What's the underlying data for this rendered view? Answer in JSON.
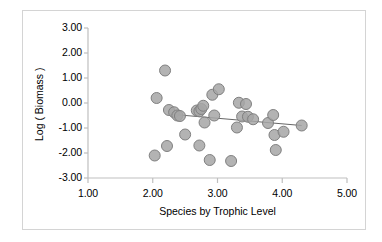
{
  "chart_data": {
    "type": "scatter",
    "title": "",
    "xlabel": "Species by Trophic Level",
    "ylabel": "Log ( Biomass )",
    "xlim": [
      1.0,
      5.0
    ],
    "ylim": [
      -3.0,
      3.0
    ],
    "xticks": [
      "1.00",
      "2.00",
      "3.00",
      "4.00",
      "5.00"
    ],
    "xtick_values": [
      1.0,
      2.0,
      3.0,
      4.0,
      5.0
    ],
    "yticks": [
      "3.00",
      "2.00",
      "1.00",
      "0.00",
      "-1.00",
      "-2.00",
      "-3.00"
    ],
    "ytick_values": [
      3.0,
      2.0,
      1.0,
      0.0,
      -1.0,
      -2.0,
      -3.0
    ],
    "grid": false,
    "legend": "none",
    "marker": {
      "shape": "circle",
      "fill_color": "#a6a6a6",
      "edge_color": "#808080",
      "size_px": 11
    },
    "series": [
      {
        "name": "observations",
        "points": [
          [
            2.03,
            -2.1
          ],
          [
            2.06,
            0.2
          ],
          [
            2.19,
            1.3
          ],
          [
            2.22,
            -1.72
          ],
          [
            2.25,
            -0.28
          ],
          [
            2.33,
            -0.37
          ],
          [
            2.38,
            -0.5
          ],
          [
            2.42,
            -0.52
          ],
          [
            2.5,
            -1.26
          ],
          [
            2.68,
            -0.3
          ],
          [
            2.72,
            -0.33
          ],
          [
            2.72,
            -1.7
          ],
          [
            2.75,
            -0.24
          ],
          [
            2.78,
            -0.11
          ],
          [
            2.8,
            -0.78
          ],
          [
            2.88,
            -2.28
          ],
          [
            2.92,
            0.33
          ],
          [
            2.95,
            -0.5
          ],
          [
            3.02,
            0.55
          ],
          [
            3.21,
            -2.32
          ],
          [
            3.3,
            -0.98
          ],
          [
            3.33,
            0.01
          ],
          [
            3.38,
            -0.54
          ],
          [
            3.44,
            -0.04
          ],
          [
            3.47,
            -0.55
          ],
          [
            3.55,
            -0.65
          ],
          [
            3.78,
            -0.8
          ],
          [
            3.86,
            -0.48
          ],
          [
            3.88,
            -1.28
          ],
          [
            3.9,
            -1.88
          ],
          [
            4.02,
            -1.15
          ],
          [
            4.3,
            -0.9
          ]
        ]
      }
    ],
    "trendline": {
      "type": "linear",
      "color": "#666666",
      "x_start": 2.33,
      "y_start": -0.46,
      "x_end": 4.3,
      "y_end": -0.9
    }
  },
  "frame": {
    "border_color": "#d4d4d4"
  }
}
